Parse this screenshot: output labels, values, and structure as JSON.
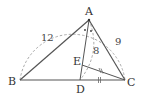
{
  "diagram": {
    "type": "geometry",
    "points": {
      "A": {
        "label": "A",
        "x": 89,
        "y": 20
      },
      "B": {
        "label": "B",
        "x": 20,
        "y": 80
      },
      "C": {
        "label": "C",
        "x": 125,
        "y": 80
      },
      "D": {
        "label": "D",
        "x": 80,
        "y": 80
      },
      "E": {
        "label": "E",
        "x": 82,
        "y": 64
      }
    },
    "segment_labels": {
      "AB": "12",
      "AC": "9",
      "AD_arc": "8"
    },
    "colors": {
      "solid_line": "#555555",
      "dashed_line": "#9a9a9a",
      "text": "#333333"
    }
  }
}
